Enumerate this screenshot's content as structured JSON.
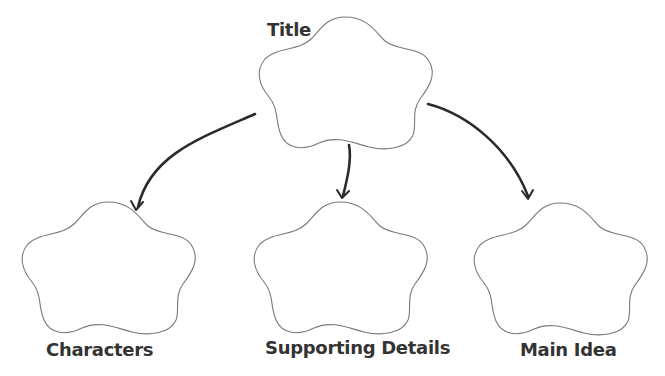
{
  "diagram": {
    "type": "graphic-organizer",
    "colors": {
      "background": "#ffffff",
      "shape_outline": "#7a7a7a",
      "arrow": "#2b2b2b",
      "label": "#333333"
    },
    "nodes": [
      {
        "id": "title",
        "label": "Title",
        "shape": "flower-cloud",
        "position": "top-center"
      },
      {
        "id": "characters",
        "label": "Characters",
        "shape": "flower-cloud",
        "position": "bottom-left"
      },
      {
        "id": "supporting-details",
        "label": "Supporting Details",
        "shape": "flower-cloud",
        "position": "bottom-center"
      },
      {
        "id": "main-idea",
        "label": "Main Idea",
        "shape": "flower-cloud",
        "position": "bottom-right"
      }
    ],
    "edges": [
      {
        "from": "title",
        "to": "characters",
        "style": "curved-arrow"
      },
      {
        "from": "title",
        "to": "supporting-details",
        "style": "curved-arrow"
      },
      {
        "from": "title",
        "to": "main-idea",
        "style": "curved-arrow"
      }
    ]
  }
}
